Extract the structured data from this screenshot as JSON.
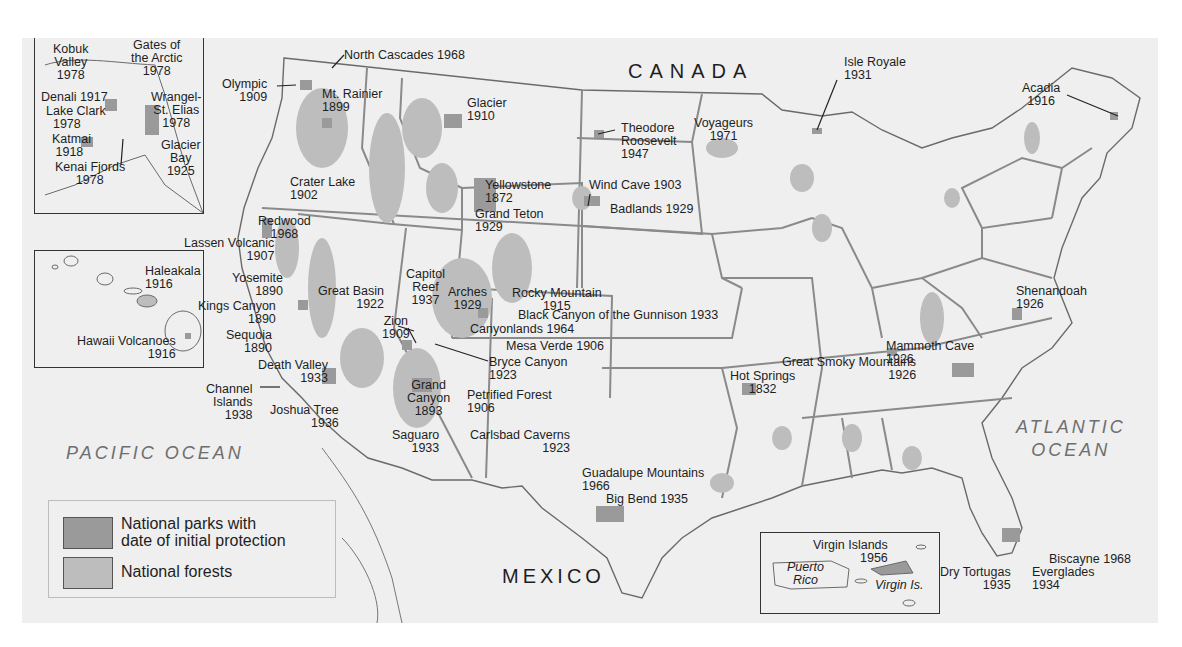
{
  "map": {
    "title_regions": {
      "canada": "CANADA",
      "mexico": "MEXICO",
      "pacific": "PACIFIC OCEAN",
      "atlantic": "ATLANTIC\nOCEAN"
    },
    "colors": {
      "background": "#efefef",
      "national_park": "#9a9a9a",
      "national_forest": "#bdbdbd",
      "state_border": "#8a8a8a",
      "coast": "#6a6a6a"
    },
    "legend": {
      "items": [
        {
          "label": "National parks with\ndate of initial protection",
          "color": "#9a9a9a"
        },
        {
          "label": "National forests",
          "color": "#bdbdbd"
        }
      ]
    },
    "insets": {
      "alaska": {
        "parks": [
          {
            "label": "Kobuk\nValley\n1978",
            "x": 18,
            "y": 8,
            "align": "c"
          },
          {
            "label": "Gates of\nthe Arctic\n1978",
            "x": 96,
            "y": 4,
            "align": "c"
          },
          {
            "label": "Denali 1917",
            "x": 6,
            "y": 56,
            "align": "l"
          },
          {
            "label": "Lake Clark\n  1978",
            "x": 11,
            "y": 70,
            "align": "l"
          },
          {
            "label": "Wrangel-\nSt. Elias\n1978",
            "x": 116,
            "y": 56,
            "align": "c"
          },
          {
            "label": "Katmai\n 1918",
            "x": 17,
            "y": 98,
            "align": "l"
          },
          {
            "label": "Glacier\nBay\n1925",
            "x": 136,
            "y": 104,
            "align": "c"
          },
          {
            "label": "Kenai Fjords\n      1978",
            "x": 28,
            "y": 126,
            "align": "l"
          }
        ]
      },
      "hawaii": {
        "parks": [
          {
            "label": "Haleakala\n1916",
            "x": 110,
            "y": 14,
            "align": "l"
          },
          {
            "label": "Hawaii Volcanoes\n1916",
            "x": 42,
            "y": 84,
            "align": "r"
          }
        ]
      },
      "caribbean": {
        "places": [
          {
            "label": "Puerto\nRico",
            "x": 26,
            "y": 28,
            "italic": true,
            "align": "c"
          },
          {
            "label": "Virgin Is.",
            "x": 114,
            "y": 46,
            "italic": true,
            "align": "l"
          }
        ],
        "parks": [
          {
            "label": "Virgin Islands\n1956",
            "x": 52,
            "y": 6,
            "align": "r"
          }
        ]
      }
    },
    "parks": [
      {
        "label": "North Cascades 1968",
        "x": 322,
        "y": 11,
        "align": "l"
      },
      {
        "label": "Olympic\n1909",
        "x": 200,
        "y": 40,
        "align": "r"
      },
      {
        "label": "Mt. Rainier\n1899",
        "x": 322,
        "y": 50,
        "align": "l"
      },
      {
        "label": "Glacier\n1910",
        "x": 445,
        "y": 59,
        "align": "l"
      },
      {
        "label": "Theodore\nRoosevelt\n1947",
        "x": 599,
        "y": 84,
        "align": "l"
      },
      {
        "label": "Voyageurs\n1971",
        "x": 690,
        "y": 79,
        "align": "c"
      },
      {
        "label": "Isle Royale\n1931",
        "x": 822,
        "y": 18,
        "align": "l"
      },
      {
        "label": "Acadia\n1916",
        "x": 1013,
        "y": 44,
        "align": "c"
      },
      {
        "label": "Crater Lake\n1902",
        "x": 268,
        "y": 138,
        "align": "l"
      },
      {
        "label": "Yellowstone\n1872",
        "x": 463,
        "y": 141,
        "align": "l"
      },
      {
        "label": "Grand Teton\n1929",
        "x": 453,
        "y": 170,
        "align": "l"
      },
      {
        "label": "Wind Cave 1903",
        "x": 567,
        "y": 141,
        "align": "l"
      },
      {
        "label": "Badlands 1929",
        "x": 588,
        "y": 165,
        "align": "l"
      },
      {
        "label": "Redwood\n1968",
        "x": 236,
        "y": 177,
        "align": "c"
      },
      {
        "label": "Lassen Volcanic\n1907",
        "x": 162,
        "y": 199,
        "align": "r"
      },
      {
        "label": "Yosemite\n1890",
        "x": 210,
        "y": 234,
        "align": "r"
      },
      {
        "label": "Great Basin\n1922",
        "x": 296,
        "y": 247,
        "align": "r"
      },
      {
        "label": "Capitol\nReef\n1937",
        "x": 384,
        "y": 230,
        "align": "c"
      },
      {
        "label": "Arches\n1929",
        "x": 426,
        "y": 248,
        "align": "c"
      },
      {
        "label": "Rocky Mountain\n1915",
        "x": 490,
        "y": 249,
        "align": "c"
      },
      {
        "label": "Kings Canyon\n1890",
        "x": 176,
        "y": 262,
        "align": "r"
      },
      {
        "label": "Black Canyon of the Gunnison 1933",
        "x": 496,
        "y": 271,
        "align": "l"
      },
      {
        "label": "Zion\n1909",
        "x": 360,
        "y": 277,
        "align": "c"
      },
      {
        "label": "Sequoia\n1890",
        "x": 204,
        "y": 291,
        "align": "r"
      },
      {
        "label": "Canyonlands 1964",
        "x": 448,
        "y": 285,
        "align": "l"
      },
      {
        "label": "Mesa Verde 1906",
        "x": 484,
        "y": 302,
        "align": "l"
      },
      {
        "label": "Bryce Canyon\n1923",
        "x": 467,
        "y": 318,
        "align": "l"
      },
      {
        "label": "Mammoth Cave\n1926",
        "x": 864,
        "y": 302,
        "align": "l"
      },
      {
        "label": "Shenandoah\n1926",
        "x": 994,
        "y": 247,
        "align": "l"
      },
      {
        "label": "Great Smoky Mountains\n1926",
        "x": 760,
        "y": 318,
        "align": "r"
      },
      {
        "label": "Death Valley\n1933",
        "x": 236,
        "y": 321,
        "align": "r"
      },
      {
        "label": "Channel\nIslands\n1938",
        "x": 202,
        "y": 345,
        "align": "r"
      },
      {
        "label": "Hot Springs\n1832",
        "x": 708,
        "y": 332,
        "align": "c"
      },
      {
        "label": "Grand\nCanyon\n1893",
        "x": 385,
        "y": 341,
        "align": "c"
      },
      {
        "label": "Petrified Forest\n1906",
        "x": 445,
        "y": 351,
        "align": "l"
      },
      {
        "label": "Joshua Tree\n1936",
        "x": 268,
        "y": 366,
        "align": "r"
      },
      {
        "label": "Saguaro\n1933",
        "x": 370,
        "y": 391,
        "align": "r"
      },
      {
        "label": "Carlsbad Caverns\n1923",
        "x": 448,
        "y": 391,
        "align": "r"
      },
      {
        "label": "Guadalupe Mountains\n1966",
        "x": 560,
        "y": 429,
        "align": "l"
      },
      {
        "label": "Big Bend 1935",
        "x": 584,
        "y": 455,
        "align": "l"
      },
      {
        "label": "Biscayne 1968",
        "x": 1027,
        "y": 515,
        "align": "l"
      },
      {
        "label": "Dry Tortugas\n1935",
        "x": 918,
        "y": 528,
        "align": "r"
      },
      {
        "label": "Everglades\n1934",
        "x": 1010,
        "y": 528,
        "align": "l"
      }
    ]
  }
}
